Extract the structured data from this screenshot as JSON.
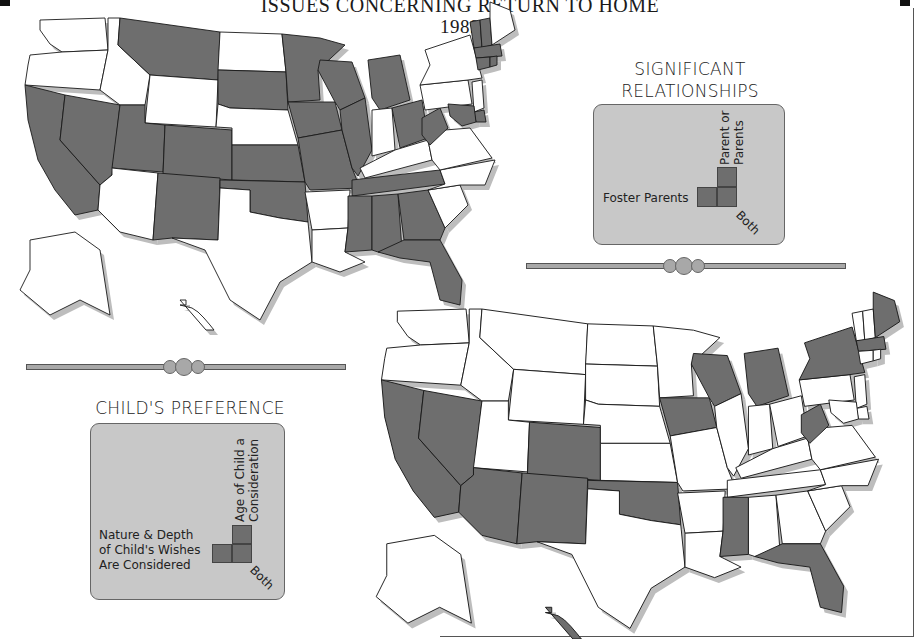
{
  "header": {
    "title_line1": "ISSUES CONCERNING RETURN TO HOME",
    "title_line2": "1989"
  },
  "colors": {
    "shaded_state": "#6e6e6e",
    "unshaded_state": "#ffffff",
    "legend_panel": "#c8c8c8",
    "state_border": "#1a1a1a",
    "drop_shadow": "#bdbdbd",
    "divider": "#a8a8a8"
  },
  "maps": [
    {
      "id": "significant-relationships",
      "legend": {
        "heading_line1": "SIGNIFICANT",
        "heading_line2": "RELATIONSHIPS",
        "labels": {
          "horizontal": "Foster Parents",
          "vertical_line1": "Parent or",
          "vertical_line2": "Parents",
          "diagonal": "Both"
        }
      },
      "shaded_states": [
        "WA?no"
      ],
      "states_shaded": [
        "MT",
        "SD",
        "MN",
        "WI",
        "MI",
        "IA",
        "IL",
        "MO",
        "KS",
        "OK",
        "CA",
        "NV",
        "UT",
        "CO",
        "NM",
        "OH",
        "WV",
        "TN",
        "MS",
        "AL",
        "GA",
        "FL",
        "VT",
        "NH",
        "MA",
        "CT",
        "RI",
        "MD",
        "DE"
      ]
    },
    {
      "id": "childs-preference",
      "legend": {
        "heading": "CHILD'S PREFERENCE",
        "labels": {
          "horizontal_line1": "Nature & Depth",
          "horizontal_line2": "of Child's Wishes",
          "horizontal_line3": "Are Considered",
          "vertical_line1": "Age of Child a",
          "vertical_line2": "Consideration",
          "diagonal": "Both"
        }
      },
      "states_shaded": [
        "CA",
        "NV",
        "AZ",
        "CO",
        "NM",
        "OK",
        "IA",
        "WI",
        "MI",
        "NY",
        "ME",
        "MA",
        "WV",
        "MS",
        "FL",
        "HI"
      ]
    }
  ]
}
